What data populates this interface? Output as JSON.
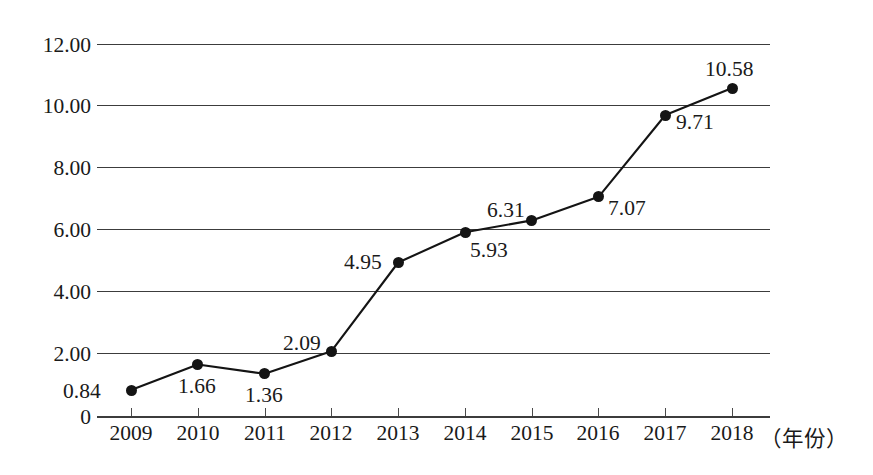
{
  "chart_data": {
    "type": "line",
    "title": "",
    "subtitle": "",
    "xlabel": "（年份）",
    "ylabel": "",
    "categories": [
      "2009",
      "2010",
      "2011",
      "2012",
      "2013",
      "2014",
      "2015",
      "2016",
      "2017",
      "2018"
    ],
    "values": [
      0.84,
      1.66,
      1.36,
      2.09,
      4.95,
      5.93,
      6.31,
      7.07,
      9.71,
      10.58
    ],
    "point_labels": [
      "0.84",
      "1.66",
      "1.36",
      "2.09",
      "4.95",
      "5.93",
      "6.31",
      "7.07",
      "9.71",
      "10.58"
    ],
    "label_placement": [
      "left",
      "below",
      "below",
      "above-left",
      "left",
      "below-right",
      "above-left",
      "right",
      "below-right",
      "above"
    ],
    "ylim": [
      0,
      12
    ],
    "ytick_values": [
      12,
      10,
      8,
      6,
      4,
      2,
      0
    ],
    "ytick_labels": [
      "12.00",
      "10.00",
      "8.00",
      "6.00",
      "4.00",
      "2.00",
      "0"
    ],
    "grid": true,
    "grid_axis": "y",
    "legend": false,
    "legend_position": "none",
    "series": [
      {
        "name": "",
        "marker": "filled-circle",
        "color": "#141414",
        "values": [
          0.84,
          1.66,
          1.36,
          2.09,
          4.95,
          5.93,
          6.31,
          7.07,
          9.71,
          10.58
        ]
      }
    ]
  },
  "colors": {
    "line": "#141414",
    "marker": "#141414",
    "grid": "#3c3c3c",
    "axis": "#3c3c3c",
    "text": "#1a1a1a",
    "background": "#ffffff"
  }
}
